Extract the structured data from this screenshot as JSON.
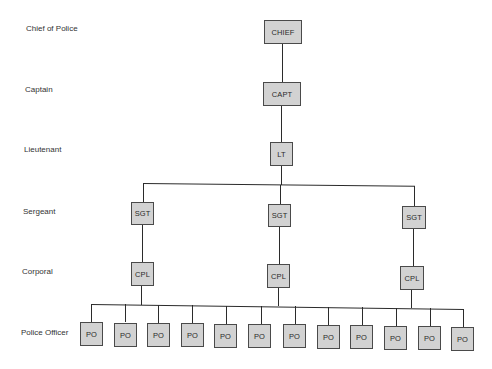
{
  "rank_labels": {
    "chief": "Chief of Police",
    "captain": "Captain",
    "lieutenant": "Lieutenant",
    "sergeant": "Sergeant",
    "corporal": "Corporal",
    "police_officer": "Police Officer"
  },
  "nodes": {
    "chief": "CHIEF",
    "captain": "CAPT",
    "lieutenant": "LT",
    "sergeants": [
      "SGT",
      "SGT",
      "SGT"
    ],
    "corporals": [
      "CPL",
      "CPL",
      "CPL"
    ],
    "officers": [
      "PO",
      "PO",
      "PO",
      "PO",
      "PO",
      "PO",
      "PO",
      "PO",
      "PO",
      "PO",
      "PO",
      "PO"
    ]
  },
  "colors": {
    "box_fill": "#d2d2d2",
    "box_border": "#4a4a4a",
    "line": "#2b2b2b",
    "text": "#333333"
  }
}
